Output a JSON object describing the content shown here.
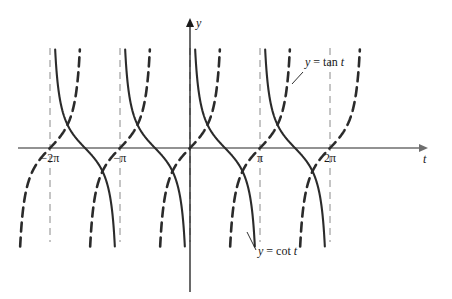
{
  "figure": {
    "background_color": "#ffffff",
    "axes": {
      "x_axis_label": "t",
      "y_axis_label": "y",
      "x_axis_color": "#6e6e6e",
      "y_axis_color": "#1a1a1a",
      "origin_px": {
        "x": 190,
        "y": 148
      },
      "pi_px": 70,
      "x_axis_start_px": 18,
      "x_axis_end_px": 428,
      "y_axis_top_px": 18,
      "y_axis_bottom_px": 292
    },
    "ticks": [
      {
        "label": "−2π",
        "value": -6.2832,
        "x_px": 50
      },
      {
        "label": "−π",
        "value": -3.1416,
        "x_px": 120
      },
      {
        "label": "π",
        "value": 3.1416,
        "x_px": 260
      },
      {
        "label": "2π",
        "value": 6.2832,
        "x_px": 330
      }
    ],
    "asymptotes": {
      "style": "dashed",
      "color": "#8a8a8a",
      "x_px": [
        50,
        120,
        190,
        260,
        330
      ],
      "top_px": 48,
      "bottom_px": 242
    },
    "curve_labels": [
      {
        "name": "tan-label",
        "text": "y = tan t",
        "y_part": "y",
        "eq_part": " = tan ",
        "t_part": "t",
        "x_px": 305,
        "y_px": 62,
        "leader_from_px": {
          "x": 303,
          "y": 72
        },
        "leader_to_px": {
          "x": 292,
          "y": 84
        }
      },
      {
        "name": "cot-label",
        "text": "y = cot t",
        "y_part": "y",
        "eq_part": " = cot ",
        "t_part": "t",
        "x_px": 258,
        "y_px": 251,
        "leader_from_px": {
          "x": 256,
          "y": 250
        },
        "leader_to_px": {
          "x": 247,
          "y": 232
        }
      }
    ]
  },
  "chart_data": {
    "type": "line",
    "xlabel": "t",
    "ylabel": "y",
    "xlim": [
      -7.6,
      8.4
    ],
    "ylim": [
      -4.3,
      4.3
    ],
    "grid": false,
    "legend": "inline-annotations",
    "x_tick_labels": [
      "−2π",
      "−π",
      "π",
      "2π"
    ],
    "x_tick_values": [
      -6.2832,
      -3.1416,
      3.1416,
      6.2832
    ],
    "series": [
      {
        "name": "y = cot t",
        "style": "solid",
        "color": "#2b2b2b",
        "line_width": 2.1,
        "period": 3.1416,
        "asymptotes_at": [
          -6.2832,
          -3.1416,
          0,
          3.1416,
          6.2832
        ],
        "zeros_at": [
          -4.7124,
          -1.5708,
          1.5708,
          4.7124
        ],
        "description": "decreasing branches from +infinity to -infinity on each interval between consecutive asymptotes"
      },
      {
        "name": "y = tan t",
        "style": "dashed",
        "color": "#2b2b2b",
        "line_width": 2.6,
        "dash_pattern": "9 6",
        "period": 3.1416,
        "asymptotes_at": [
          -7.854,
          -4.7124,
          -1.5708,
          1.5708,
          4.7124,
          7.854
        ],
        "zeros_at": [
          -6.2832,
          -3.1416,
          0,
          3.1416,
          6.2832
        ],
        "description": "increasing branches from -infinity to +infinity on each interval between consecutive asymptotes"
      }
    ]
  }
}
